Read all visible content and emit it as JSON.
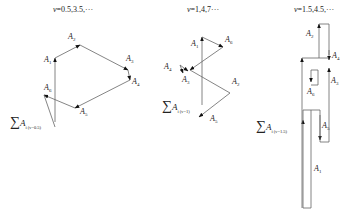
{
  "panels": [
    {
      "id": "nu-0.5",
      "title_var": "ν",
      "title_rest": "=0.5,3.5,···",
      "vectors": [
        "A1",
        "A2",
        "A3",
        "A4",
        "A5",
        "A6"
      ],
      "labels": {
        "A1": "A",
        "A1_sub": "1",
        "A2": "A",
        "A2_sub": "2",
        "A3": "A",
        "A3_sub": "3",
        "A4": "A",
        "A4_sub": "4",
        "A5": "A",
        "A5_sub": "5",
        "A6": "A",
        "A6_sub": "6"
      },
      "sum_label": {
        "sigma": "∑",
        "var": "A",
        "sub": "i (ν=0.5)"
      }
    },
    {
      "id": "nu-1",
      "title_var": "ν",
      "title_rest": "=1,4,7···",
      "vectors": [
        "A1",
        "A2",
        "A3",
        "A4",
        "A5",
        "A6"
      ],
      "labels": {
        "A1": "A",
        "A1_sub": "1",
        "A2": "A",
        "A2_sub": "2",
        "A3": "A",
        "A3_sub": "3",
        "A4": "A",
        "A4_sub": "4",
        "A5": "A",
        "A5_sub": "5",
        "A6": "A",
        "A6_sub": "6"
      },
      "sum_label": {
        "sigma": "∑",
        "var": "A",
        "sub": "i (ν=1)"
      }
    },
    {
      "id": "nu-1.5",
      "title_var": "ν",
      "title_rest": "=1.5,4.5,···",
      "vectors": [
        "A1",
        "A2",
        "A3",
        "A4",
        "A5",
        "A6"
      ],
      "labels": {
        "A1": "A",
        "A1_sub": "1",
        "A2": "A",
        "A2_sub": "2",
        "A3": "A",
        "A3_sub": "3",
        "A4": "A",
        "A4_sub": "4",
        "A5": "A",
        "A5_sub": "5",
        "A6": "A",
        "A6_sub": "6"
      },
      "sum_label": {
        "sigma": "∑",
        "var": "A",
        "sub": "i (ν=1.5)"
      }
    }
  ],
  "colors": {
    "line": "#555555",
    "arrow": "#111111",
    "background": "#ffffff"
  }
}
